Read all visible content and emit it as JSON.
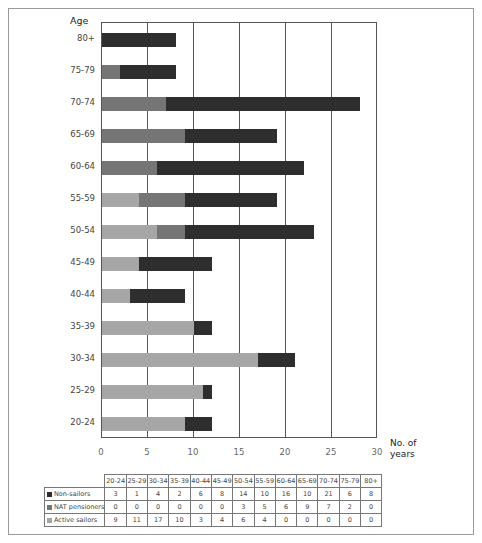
{
  "chart_data": {
    "type": "bar",
    "orientation": "horizontal",
    "stacked": true,
    "title": "",
    "ylabel": "Age",
    "xlabel": "No. of years",
    "xlim": [
      0,
      30
    ],
    "xticks": [
      "0",
      "5",
      "10",
      "15",
      "20",
      "25",
      "30"
    ],
    "grid": true,
    "categories": [
      "20-24",
      "25-29",
      "30-34",
      "35-39",
      "40-44",
      "45-49",
      "50-54",
      "55-59",
      "60-64",
      "65-69",
      "70-74",
      "75-79",
      "80+"
    ],
    "series": [
      {
        "name": "Non-sailors",
        "color": "#2e2e2e",
        "values": [
          3,
          1,
          4,
          2,
          6,
          8,
          14,
          10,
          16,
          10,
          21,
          6,
          8
        ]
      },
      {
        "name": "NAT pensioners",
        "color": "#757575",
        "values": [
          0,
          0,
          0,
          0,
          0,
          0,
          3,
          5,
          6,
          9,
          7,
          2,
          0
        ]
      },
      {
        "name": "Active sailors",
        "color": "#a6a6a6",
        "values": [
          9,
          11,
          17,
          10,
          3,
          4,
          6,
          4,
          0,
          0,
          0,
          0,
          0
        ]
      }
    ],
    "legend_position": "data table below chart"
  },
  "labels": {
    "y_axis_title": "Age",
    "x_axis_title_line1": "No. of",
    "x_axis_title_line2": "years"
  },
  "table": {
    "headers": [
      "20-24",
      "25-29",
      "30-34",
      "35-39",
      "40-44",
      "45-49",
      "50-54",
      "55-59",
      "60-64",
      "65-69",
      "70-74",
      "75-79",
      "80+"
    ],
    "rows": [
      {
        "label": "Non-sailors",
        "values": [
          "3",
          "1",
          "4",
          "2",
          "6",
          "8",
          "14",
          "10",
          "16",
          "10",
          "21",
          "6",
          "8"
        ]
      },
      {
        "label": "NAT pensioners",
        "values": [
          "0",
          "0",
          "0",
          "0",
          "0",
          "0",
          "3",
          "5",
          "6",
          "9",
          "7",
          "2",
          "0"
        ]
      },
      {
        "label": "Active sailors",
        "values": [
          "9",
          "11",
          "17",
          "10",
          "3",
          "4",
          "6",
          "4",
          "0",
          "0",
          "0",
          "0",
          "0"
        ]
      }
    ]
  }
}
